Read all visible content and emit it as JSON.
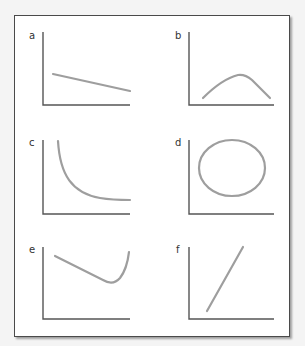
{
  "figure": {
    "panels": [
      {
        "label": "a",
        "shape": "linear-decreasing",
        "description": "Straight line sloping gently downward"
      },
      {
        "label": "b",
        "shape": "inverted-U",
        "description": "Curve rising to a peak then falling"
      },
      {
        "label": "c",
        "shape": "inverse-decay",
        "description": "Steeply falling curve leveling off to an asymptote"
      },
      {
        "label": "d",
        "shape": "ellipse",
        "description": "Closed circle/ellipse"
      },
      {
        "label": "e",
        "shape": "U-shaped-asymmetric",
        "description": "Decreasing line then sharp rise"
      },
      {
        "label": "f",
        "shape": "linear-increasing",
        "description": "Straight line sloping steeply upward"
      }
    ]
  },
  "colors": {
    "axis": "#555555",
    "curve": "#9e9e9e",
    "frame_border": "#4a4a4a",
    "background": "#ffffff"
  }
}
